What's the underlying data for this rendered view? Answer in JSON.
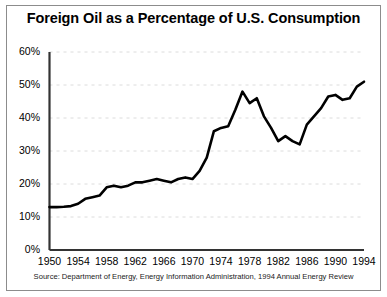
{
  "chart_data": {
    "type": "line",
    "title": "Foreign Oil as a Percentage of U.S. Consumption",
    "source": "Source: Department of Energy, Energy Information Administration, 1994 Annual Energy Review",
    "xlabel": "",
    "ylabel": "",
    "xlim": [
      1950,
      1994
    ],
    "ylim": [
      0,
      60
    ],
    "grid": true,
    "legend": false,
    "ytick_labels": [
      "0%",
      "10%",
      "20%",
      "30%",
      "40%",
      "50%",
      "60%"
    ],
    "ytick_values": [
      0,
      10,
      20,
      30,
      40,
      50,
      60
    ],
    "xtick_labels": [
      "1950",
      "1954",
      "1958",
      "1962",
      "1966",
      "1970",
      "1974",
      "1978",
      "1982",
      "1986",
      "1990",
      "1994"
    ],
    "xtick_values": [
      1950,
      1954,
      1958,
      1962,
      1966,
      1970,
      1974,
      1978,
      1982,
      1986,
      1990,
      1994
    ],
    "line_color": "#000000",
    "x": [
      1950,
      1951,
      1952,
      1953,
      1954,
      1955,
      1956,
      1957,
      1958,
      1959,
      1960,
      1961,
      1962,
      1963,
      1964,
      1965,
      1966,
      1967,
      1968,
      1969,
      1970,
      1971,
      1972,
      1973,
      1974,
      1975,
      1976,
      1977,
      1978,
      1979,
      1980,
      1981,
      1982,
      1983,
      1984,
      1985,
      1986,
      1987,
      1988,
      1989,
      1990,
      1991,
      1992,
      1993,
      1994
    ],
    "values": [
      13.0,
      13.0,
      13.1,
      13.3,
      14.0,
      15.5,
      16.0,
      16.5,
      19.0,
      19.5,
      19.0,
      19.5,
      20.5,
      20.5,
      21.0,
      21.5,
      21.0,
      20.5,
      21.5,
      22.0,
      21.5,
      24.0,
      28.0,
      36.0,
      37.0,
      37.5,
      42.5,
      48.0,
      44.5,
      46.0,
      40.5,
      37.0,
      33.0,
      34.5,
      33.0,
      32.0,
      38.0,
      40.5,
      43.0,
      46.5,
      47.0,
      45.5,
      46.0,
      49.5,
      51.0
    ]
  }
}
